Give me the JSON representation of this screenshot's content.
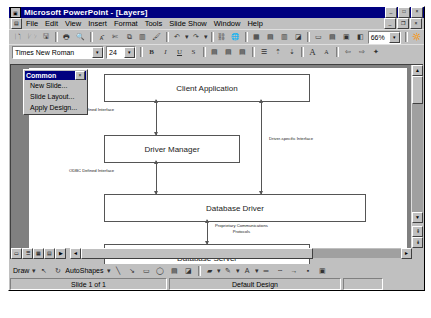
{
  "window": {
    "title": "Microsoft PowerPoint - [Layers]",
    "sysicon": "powerpoint-icon",
    "minimize": "_",
    "maximize": "□",
    "close": "×"
  },
  "mdi": {
    "icon": "document-icon",
    "minimize": "_",
    "restore": "❐",
    "close": "×"
  },
  "menu": {
    "items": [
      {
        "label": "File"
      },
      {
        "label": "Edit"
      },
      {
        "label": "View"
      },
      {
        "label": "Insert"
      },
      {
        "label": "Format"
      },
      {
        "label": "Tools"
      },
      {
        "label": "Slide Show"
      },
      {
        "label": "Window"
      },
      {
        "label": "Help"
      }
    ]
  },
  "standard_toolbar": {
    "zoom_value": "66%",
    "zoom_arrow": "▾",
    "buttons": [
      {
        "name": "new-icon",
        "glyph": "🗋"
      },
      {
        "name": "open-icon",
        "glyph": "🗁"
      },
      {
        "name": "save-icon",
        "glyph": "🖫"
      },
      {
        "name": "print-icon",
        "glyph": "🖶"
      },
      {
        "name": "print-preview-icon",
        "glyph": "🔍"
      },
      {
        "name": "spelling-icon",
        "glyph": "ᗅ"
      },
      {
        "name": "cut-icon",
        "glyph": "✂"
      },
      {
        "name": "copy-icon",
        "glyph": "⧉"
      },
      {
        "name": "paste-icon",
        "glyph": "📋"
      },
      {
        "name": "format-painter-icon",
        "glyph": "🖌"
      },
      {
        "name": "undo-icon",
        "glyph": "↶"
      },
      {
        "name": "undo-dropdown-icon",
        "glyph": "▾"
      },
      {
        "name": "redo-icon",
        "glyph": "↷"
      },
      {
        "name": "redo-dropdown-icon",
        "glyph": "▾"
      },
      {
        "name": "insert-hyperlink-icon",
        "glyph": "🌐"
      },
      {
        "name": "web-toolbar-icon",
        "glyph": "🧭"
      },
      {
        "name": "insert-table-icon",
        "glyph": "▦"
      },
      {
        "name": "insert-excel-icon",
        "glyph": "▤"
      },
      {
        "name": "insert-chart-icon",
        "glyph": "▥"
      },
      {
        "name": "insert-clipart-icon",
        "glyph": "◪"
      },
      {
        "name": "new-slide-icon",
        "glyph": "▭"
      },
      {
        "name": "slide-layout-icon",
        "glyph": "▤"
      },
      {
        "name": "apply-design-icon",
        "glyph": "▣"
      },
      {
        "name": "black-white-view-icon",
        "glyph": "◧"
      }
    ],
    "help_button": {
      "name": "office-assistant-icon",
      "glyph": "?"
    }
  },
  "formatting_toolbar": {
    "font_name": "Times New Roman",
    "font_size": "24",
    "dropdown_arrow": "▾",
    "buttons": [
      {
        "name": "bold-icon",
        "glyph": "B"
      },
      {
        "name": "italic-icon",
        "glyph": "I"
      },
      {
        "name": "underline-icon",
        "glyph": "U"
      },
      {
        "name": "shadow-icon",
        "glyph": "S"
      },
      {
        "name": "align-left-icon",
        "glyph": "▤"
      },
      {
        "name": "align-center-icon",
        "glyph": "▤"
      },
      {
        "name": "align-right-icon",
        "glyph": "▤"
      },
      {
        "name": "bullets-icon",
        "glyph": "☰"
      },
      {
        "name": "increase-paragraph-spacing-icon",
        "glyph": "⇕"
      },
      {
        "name": "decrease-paragraph-spacing-icon",
        "glyph": "⇕"
      },
      {
        "name": "increase-font-size-icon",
        "glyph": "A"
      },
      {
        "name": "decrease-font-size-icon",
        "glyph": "a"
      },
      {
        "name": "promote-icon",
        "glyph": "⇦"
      },
      {
        "name": "demote-icon",
        "glyph": "⇨"
      },
      {
        "name": "animation-effects-icon",
        "glyph": "★"
      }
    ]
  },
  "common_palette": {
    "title": "Common",
    "close": "×",
    "items": [
      {
        "label": "New Slide..."
      },
      {
        "label": "Slide Layout..."
      },
      {
        "label": "Apply Design..."
      }
    ]
  },
  "slide": {
    "boxes": [
      {
        "label": "Client Application"
      },
      {
        "label": "Driver Manager"
      },
      {
        "label": "Database Driver"
      },
      {
        "label": "Database Server"
      }
    ],
    "connector_labels": [
      {
        "label": "ODBC Defined Interface"
      },
      {
        "label": "Driver-specific Interface"
      },
      {
        "label": "ODBC Defined Interface"
      },
      {
        "label": "Proprietary Communications",
        "label2": "Protocols"
      }
    ]
  },
  "drawing_toolbar": {
    "draw_label": "Draw",
    "autoshapes_label": "AutoShapes",
    "arrow": "▾",
    "buttons": [
      {
        "name": "select-objects-icon",
        "glyph": "↖"
      },
      {
        "name": "free-rotate-icon",
        "glyph": "↻"
      },
      {
        "name": "line-icon",
        "glyph": "╲"
      },
      {
        "name": "arrow-icon",
        "glyph": "↘"
      },
      {
        "name": "rectangle-icon",
        "glyph": "▭"
      },
      {
        "name": "oval-icon",
        "glyph": "◯"
      },
      {
        "name": "text-box-icon",
        "glyph": "▤"
      },
      {
        "name": "insert-wordart-icon",
        "glyph": "◪"
      },
      {
        "name": "fill-color-icon",
        "glyph": "🪣"
      },
      {
        "name": "line-color-icon",
        "glyph": "✎"
      },
      {
        "name": "font-color-icon",
        "glyph": "A"
      },
      {
        "name": "line-style-icon",
        "glyph": "═"
      },
      {
        "name": "dash-style-icon",
        "glyph": "┄"
      },
      {
        "name": "arrow-style-icon",
        "glyph": "→"
      },
      {
        "name": "shadow-icon",
        "glyph": "▪"
      },
      {
        "name": "3d-icon",
        "glyph": "▣"
      }
    ]
  },
  "statusbar": {
    "slide_info": "Slide 1 of 1",
    "design_name": "Default Design",
    "extra": ""
  },
  "view_buttons": [
    {
      "name": "slide-view-icon",
      "glyph": "▭"
    },
    {
      "name": "outline-view-icon",
      "glyph": "☰"
    },
    {
      "name": "slide-sorter-view-icon",
      "glyph": "▦"
    },
    {
      "name": "notes-page-view-icon",
      "glyph": "▤"
    },
    {
      "name": "slide-show-view-icon",
      "glyph": "▶"
    }
  ],
  "scrollbar": {
    "up": "▲",
    "down": "▼",
    "left": "◄",
    "right": "►",
    "prev_slide": "⇞",
    "next_slide": "⇟",
    "expand": "▤"
  }
}
